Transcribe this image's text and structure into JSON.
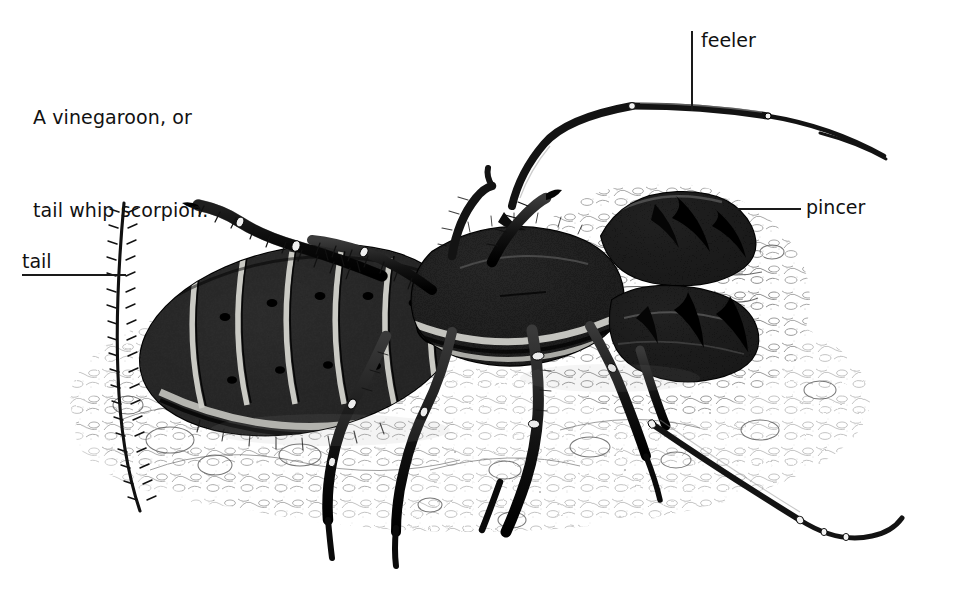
{
  "figure": {
    "kind": "scientific-illustration",
    "subject": "vinegaroon",
    "medium": "pen-and-ink stipple drawing",
    "background_color": "#ffffff",
    "ink_color": "#1a1a1a",
    "width": 979,
    "height": 589
  },
  "caption": {
    "line1": "A vinegaroon, or",
    "line2": "tail whip scorpion."
  },
  "labels": [
    {
      "id": "feeler",
      "text": "feeler",
      "leader": "vertical"
    },
    {
      "id": "pincer",
      "text": "pincer",
      "leader": "horizontal"
    },
    {
      "id": "tail",
      "text": "tail",
      "leader": "horizontal"
    }
  ],
  "label_text": {
    "feeler": "feeler",
    "pincer": "pincer",
    "tail": "tail"
  },
  "anatomy": {
    "abdomen_segments": 8,
    "legs": 6,
    "pincers": 2,
    "feelers": 2,
    "tail_whip": 1
  }
}
